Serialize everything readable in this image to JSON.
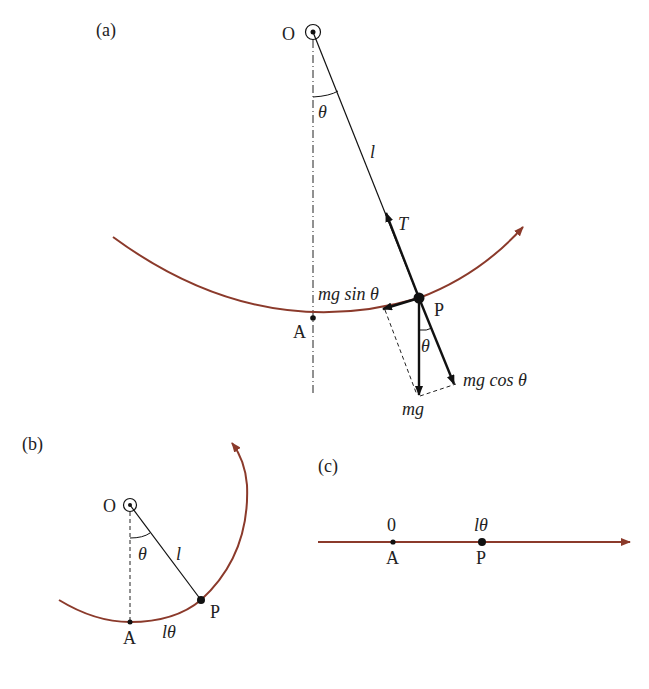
{
  "colors": {
    "arc": "#8b3a2b",
    "line": "#111111"
  },
  "panel_a": {
    "label": "(a)",
    "pivot_label": "O",
    "theta_top": "θ",
    "length_label": "l",
    "tension_label": "T",
    "point_p": "P",
    "point_a": "A",
    "tangential_force": "mg sin θ",
    "radial_force": "mg cos θ",
    "theta_bottom": "θ",
    "weight": "mg"
  },
  "panel_b": {
    "label": "(b)",
    "pivot_label": "O",
    "theta": "θ",
    "length_label": "l",
    "point_p": "P",
    "point_a": "A",
    "arc_length": "lθ"
  },
  "panel_c": {
    "label": "(c)",
    "origin_value": "0",
    "p_value": "lθ",
    "point_a": "A",
    "point_p": "P"
  }
}
